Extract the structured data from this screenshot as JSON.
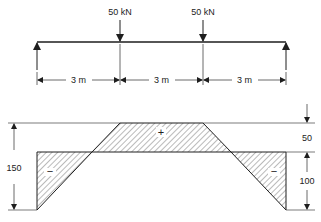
{
  "colors": {
    "ink": "#1e1e1e",
    "thin": "#444444",
    "hatch": "#555555",
    "background": "#ffffff"
  },
  "beam": {
    "loads": [
      {
        "label": "50 kN",
        "position_m": 3
      },
      {
        "label": "50 kN",
        "position_m": 6
      }
    ],
    "supports": [
      {
        "type": "reaction-arrow-up",
        "position_m": 0
      },
      {
        "type": "reaction-arrow-up",
        "position_m": 9
      }
    ],
    "spans": [
      {
        "label": "3 m"
      },
      {
        "label": "3 m"
      },
      {
        "label": "3 m"
      }
    ]
  },
  "diagram": {
    "regions": [
      {
        "sign": "−",
        "label": "negative-left"
      },
      {
        "sign": "+",
        "label": "positive-middle"
      },
      {
        "sign": "−",
        "label": "negative-right"
      }
    ],
    "dimensions": {
      "total_left": "150",
      "upper_right": "50",
      "lower_right": "100"
    }
  }
}
